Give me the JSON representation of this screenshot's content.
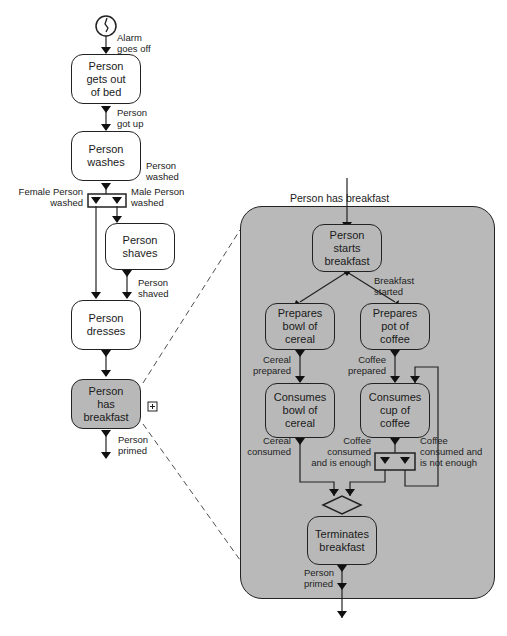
{
  "main_flow": {
    "start_event": "Alarm\ngoes off",
    "steps": [
      {
        "label": "Person\ngets out\nof bed"
      },
      {
        "label": "Person\nwashes"
      },
      {
        "label": "Person\nshaves"
      },
      {
        "label": "Person\ndresses"
      },
      {
        "label": "Person\nhas\nbreakfast"
      }
    ],
    "events": {
      "got_up": "Person\ngot up",
      "washed": "Person\nwashed",
      "female_washed": "Female Person\nwashed",
      "male_washed": "Male Person\nwashed",
      "shaved": "Person\nshaved",
      "primed": "Person\nprimed"
    },
    "expand_icon": "+"
  },
  "detail": {
    "title": "Person has breakfast",
    "steps": [
      {
        "label": "Person\nstarts\nbreakfast"
      },
      {
        "label": "Prepares\nbowl of\ncereal"
      },
      {
        "label": "Prepares\npot of\ncoffee"
      },
      {
        "label": "Consumes\nbowl of\ncereal"
      },
      {
        "label": "Consumes\ncup of\ncoffee"
      },
      {
        "label": "Terminates\nbreakfast"
      }
    ],
    "events": {
      "started": "Breakfast\nstarted",
      "cereal_prepared": "Cereal\nprepared",
      "coffee_prepared": "Coffee\nprepared",
      "cereal_consumed": "Cereal\nconsumed",
      "coffee_enough": "Coffee\nconsumed\nand is enough",
      "coffee_not_enough": "Coffee\nconsumed and\nis not enough",
      "primed": "Person\nprimed"
    }
  },
  "colors": {
    "activity_fill": "#ffffff",
    "expanded_fill": "#b9b9b9",
    "stroke": "#222222"
  }
}
